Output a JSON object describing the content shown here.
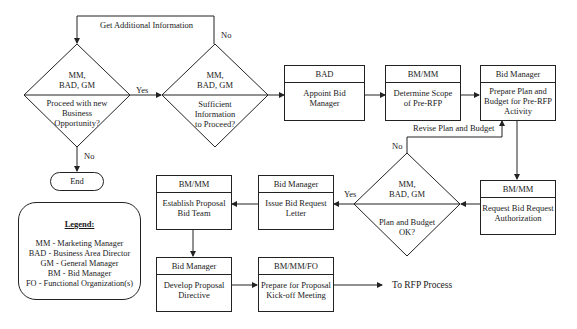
{
  "diagram": {
    "type": "flowchart",
    "decisions": [
      {
        "id": "d1",
        "owner_line1": "MM,",
        "owner_line2": "BAD, GM",
        "question_lines": [
          "Proceed with new",
          "Business",
          "Opportunity?"
        ]
      },
      {
        "id": "d2",
        "owner_line1": "MM,",
        "owner_line2": "BAD, GM",
        "question_lines": [
          "Sufficient",
          "Information",
          "to Proceed?"
        ]
      },
      {
        "id": "d3",
        "owner_line1": "MM,",
        "owner_line2": "BAD, GM",
        "question_lines": [
          "Plan and Budget",
          "OK?"
        ]
      }
    ],
    "processes": [
      {
        "id": "p1",
        "owner": "BAD",
        "task_lines": [
          "Appoint Bid",
          "Manager"
        ]
      },
      {
        "id": "p2",
        "owner": "BM/MM",
        "task_lines": [
          "Determine Scope",
          "of Pre-RFP"
        ]
      },
      {
        "id": "p3",
        "owner": "Bid Manager",
        "task_lines": [
          "Prepare Plan and",
          "Budget for Pre-RFP",
          "Activity"
        ]
      },
      {
        "id": "p4",
        "owner": "BM/MM",
        "task_lines": [
          "Request Bid Request",
          "Authorization"
        ]
      },
      {
        "id": "p5",
        "owner": "Bid Manager",
        "task_lines": [
          "Issue Bid Request",
          "Letter"
        ]
      },
      {
        "id": "p6",
        "owner": "BM/MM",
        "task_lines": [
          "Establish Proposal",
          "Bid Team"
        ]
      },
      {
        "id": "p7",
        "owner": "Bid Manager",
        "task_lines": [
          "Develop Proposal",
          "Directive"
        ]
      },
      {
        "id": "p8",
        "owner": "BM/MM/FO",
        "task_lines": [
          "Prepare for Proposal",
          "Kick-off Meeting"
        ]
      }
    ],
    "terminal": {
      "label": "End"
    },
    "edge_labels": {
      "get_additional_info": "Get Additional Information",
      "d2_no": "No",
      "d1_yes": "Yes",
      "d1_no": "No",
      "revise": "Revise Plan and Budget",
      "d3_no": "No",
      "d3_yes": "Yes",
      "to_rfp": "To RFP Process"
    },
    "legend": {
      "title": "Legend:",
      "items": [
        "MM - Marketing Manager",
        "BAD - Business Area Director",
        "GM - General Manager",
        "BM - Bid Manager",
        "FO - Functional Organization(s)"
      ]
    }
  }
}
